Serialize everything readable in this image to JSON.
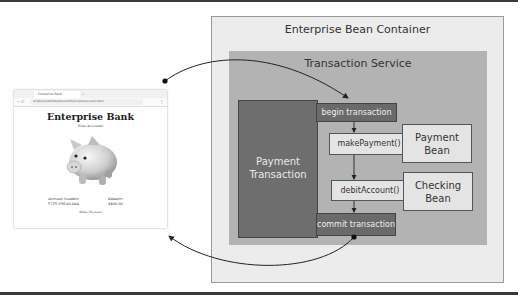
{
  "browser": {
    "tab_title": "Enterprise Bank",
    "tab_close": "×",
    "nav": "← C",
    "url": "localhost:8181/BankAccountInterceptor/account.xhtml",
    "menu": "⋮",
    "page_title": "Enterprise Bank",
    "subtitle": "Your accounts",
    "image": "piggy-bank",
    "account_number_label": "Account Number",
    "account_number_value": "9729-396-XYXXX",
    "balance_label": "Balance",
    "balance_value": "$400.00",
    "action_link": "Make Payment"
  },
  "diagram": {
    "container_title": "Enterprise Bean Container",
    "service_title": "Transaction Service",
    "transaction_label_line1": "Payment",
    "transaction_label_line2": "Transaction",
    "steps": [
      {
        "label": "begin transaction",
        "style": "dark"
      },
      {
        "label": "makePayment()",
        "style": "light"
      },
      {
        "label": "debitAccount()",
        "style": "light"
      },
      {
        "label": "commit transaction",
        "style": "dark"
      }
    ],
    "beans": [
      {
        "line1": "Payment",
        "line2": "Bean"
      },
      {
        "line1": "Checking",
        "line2": "Bean"
      }
    ],
    "colors": {
      "container_bg": "#ececec",
      "service_bg": "#b3b3b3",
      "transaction_bg": "#6e6e6e",
      "step_dark": "#6a6a6a",
      "step_light": "#e4e4e4",
      "connector": "#222222"
    }
  }
}
